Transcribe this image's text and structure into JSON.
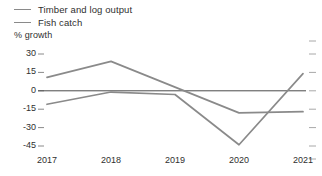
{
  "chart_data": {
    "type": "line",
    "title": "",
    "subtitle": "",
    "xlabel": "",
    "ylabel": "% growth",
    "categories": [
      "2017",
      "2018",
      "2019",
      "2020",
      "2021"
    ],
    "x": [
      2017,
      2018,
      2019,
      2020,
      2021
    ],
    "ylim": [
      -45,
      30
    ],
    "yticks": [
      30,
      15,
      0,
      -15,
      -30,
      -45
    ],
    "ytick_labels": [
      "30",
      "15",
      "0",
      "-15",
      "-30",
      "-45"
    ],
    "xtick_labels": [
      "2017",
      "2018",
      "2019",
      "2020",
      "2021"
    ],
    "grid": false,
    "zero_line": true,
    "legend_position": "top-left",
    "series": [
      {
        "name": "Timber and log output",
        "color": "#8a8a8a",
        "values": [
          11,
          24,
          3,
          -18,
          -17
        ]
      },
      {
        "name": "Fish catch",
        "color": "#8a8a8a",
        "values": [
          -11,
          -1,
          -3,
          -44,
          14
        ]
      }
    ]
  },
  "legend": {
    "items": [
      {
        "label": "Timber and log output",
        "swatch": "line-swatch-icon"
      },
      {
        "label": "Fish catch",
        "swatch": "line-swatch-icon"
      }
    ]
  },
  "axes": {
    "y_caption": "% growth"
  }
}
